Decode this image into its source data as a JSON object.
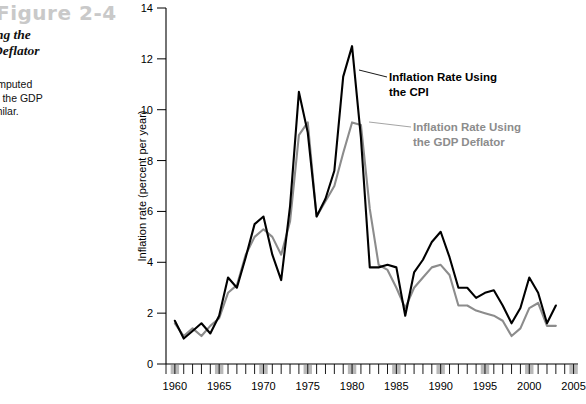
{
  "figure": {
    "label": "Figure 2-4",
    "title_lines": [
      "n Rate, Using the",
      "f the GDP Deflator",
      "60"
    ],
    "body_lines": [
      "ion rates, computed",
      "er the CPI or the GDP",
      "re largely similar."
    ]
  },
  "colors": {
    "cpi": "#000000",
    "deflator": "#8c8c8c",
    "recession_bar": "#b9b9b9",
    "figure_label": "#c9c9c9"
  },
  "annotations": {
    "cpi": [
      "Inflation Rate Using",
      "the CPI"
    ],
    "deflator": [
      "Inflation Rate Using",
      "the GDP Deflator"
    ]
  },
  "chart_data": {
    "type": "line",
    "title": "",
    "xlabel": "",
    "ylabel": "Inflation rate (percent per year)",
    "xlim": [
      1959,
      2005.5
    ],
    "ylim": [
      0,
      14
    ],
    "yticks": [
      0,
      2,
      4,
      6,
      8,
      10,
      12,
      14
    ],
    "xticks_major": [
      1960,
      1965,
      1970,
      1975,
      1980,
      1985,
      1990,
      1995,
      2000,
      2005
    ],
    "xtick_minor_step": 1,
    "grid": false,
    "legend_position": "inline-annotations",
    "recession_bars_at": [
      1960,
      1965,
      1970,
      1975,
      1980,
      1985,
      1990,
      1995,
      2000,
      2005
    ],
    "x": [
      1960,
      1961,
      1962,
      1963,
      1964,
      1965,
      1966,
      1967,
      1968,
      1969,
      1970,
      1971,
      1972,
      1973,
      1974,
      1975,
      1976,
      1977,
      1978,
      1979,
      1980,
      1981,
      1982,
      1983,
      1984,
      1985,
      1986,
      1987,
      1988,
      1989,
      1990,
      1991,
      1992,
      1993,
      1994,
      1995,
      1996,
      1997,
      1998,
      1999,
      2000,
      2001,
      2002,
      2003
    ],
    "series": [
      {
        "name": "Inflation Rate Using the CPI",
        "color": "#000000",
        "values": [
          1.7,
          1.0,
          1.3,
          1.6,
          1.2,
          1.9,
          3.4,
          3.0,
          4.2,
          5.5,
          5.8,
          4.3,
          3.3,
          6.2,
          10.7,
          9.1,
          5.8,
          6.5,
          7.6,
          11.3,
          12.5,
          8.9,
          3.8,
          3.8,
          3.9,
          3.8,
          1.9,
          3.6,
          4.1,
          4.8,
          5.2,
          4.2,
          3.0,
          3.0,
          2.6,
          2.8,
          2.9,
          2.3,
          1.6,
          2.2,
          3.4,
          2.8,
          1.6,
          2.3
        ]
      },
      {
        "name": "Inflation Rate Using the GDP Deflator",
        "color": "#8c8c8c",
        "values": [
          1.6,
          1.1,
          1.4,
          1.1,
          1.5,
          1.8,
          2.8,
          3.1,
          4.3,
          5.0,
          5.3,
          5.0,
          4.3,
          5.6,
          9.0,
          9.5,
          5.8,
          6.4,
          7.0,
          8.3,
          9.5,
          9.4,
          6.1,
          3.9,
          3.7,
          3.0,
          2.2,
          3.0,
          3.4,
          3.8,
          3.9,
          3.5,
          2.3,
          2.3,
          2.1,
          2.0,
          1.9,
          1.7,
          1.1,
          1.4,
          2.2,
          2.4,
          1.5,
          1.5
        ]
      }
    ]
  }
}
